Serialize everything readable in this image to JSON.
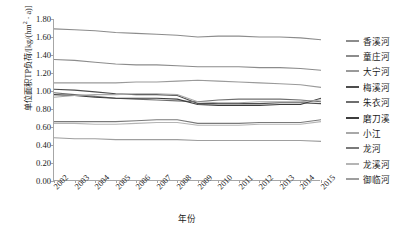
{
  "chart_data": {
    "type": "line",
    "title": "",
    "xlabel": "年份",
    "ylabel": "单位面积TP负荷/[kg/(hm² · a)]",
    "ylabel_parts": {
      "main": "单位面积TP负荷/[kg/(hm",
      "sup": "2",
      "tail": " · a)]"
    },
    "x": [
      2002,
      2003,
      2004,
      2005,
      2006,
      2007,
      2008,
      2009,
      2010,
      2011,
      2012,
      2013,
      2014,
      2015
    ],
    "categories": [
      "2002",
      "2003",
      "2004",
      "2005",
      "2006",
      "2007",
      "2008",
      "2009",
      "2010",
      "2011",
      "2012",
      "2013",
      "2014",
      "2015"
    ],
    "ylim": [
      0.0,
      1.8
    ],
    "yticks": [
      "0.00",
      "0.20",
      "0.40",
      "0.60",
      "0.80",
      "1.00",
      "1.20",
      "1.40",
      "1.60",
      "1.80"
    ],
    "ytick_values": [
      0.0,
      0.2,
      0.4,
      0.6,
      0.8,
      1.0,
      1.2,
      1.4,
      1.6,
      1.8
    ],
    "grid": false,
    "legend_position": "right",
    "series": [
      {
        "name": "香溪河",
        "color": "#8c8c8c",
        "values": [
          1.69,
          1.68,
          1.67,
          1.65,
          1.64,
          1.63,
          1.62,
          1.6,
          1.61,
          1.61,
          1.6,
          1.6,
          1.59,
          1.57
        ]
      },
      {
        "name": "童庄河",
        "color": "#8c8c8c",
        "values": [
          1.35,
          1.34,
          1.32,
          1.3,
          1.29,
          1.29,
          1.28,
          1.27,
          1.27,
          1.27,
          1.26,
          1.26,
          1.25,
          1.23
        ]
      },
      {
        "name": "大宁河",
        "color": "#9a9a9a",
        "values": [
          1.09,
          1.09,
          1.09,
          1.09,
          1.1,
          1.1,
          1.11,
          1.12,
          1.11,
          1.1,
          1.09,
          1.08,
          1.07,
          1.04
        ]
      },
      {
        "name": "梅溪河",
        "color": "#4d4d4d",
        "values": [
          1.02,
          1.01,
          0.99,
          0.97,
          0.96,
          0.96,
          0.95,
          0.86,
          0.86,
          0.86,
          0.86,
          0.87,
          0.87,
          0.86
        ]
      },
      {
        "name": "朱衣河",
        "color": "#6e6e6e",
        "values": [
          0.98,
          0.96,
          0.94,
          0.92,
          0.91,
          0.9,
          0.89,
          0.88,
          0.9,
          0.91,
          0.91,
          0.91,
          0.9,
          0.88
        ]
      },
      {
        "name": "磨刀溪",
        "color": "#3d3d3d",
        "values": [
          0.96,
          0.95,
          0.93,
          0.92,
          0.92,
          0.92,
          0.91,
          0.85,
          0.84,
          0.84,
          0.84,
          0.85,
          0.85,
          0.92
        ]
      },
      {
        "name": "小江",
        "color": "#a8a8a8",
        "values": [
          0.93,
          0.95,
          0.96,
          0.96,
          0.97,
          0.97,
          0.96,
          0.88,
          0.87,
          0.87,
          0.88,
          0.88,
          0.88,
          0.9
        ]
      },
      {
        "name": "龙河",
        "color": "#7a7a7a",
        "values": [
          0.66,
          0.66,
          0.66,
          0.66,
          0.67,
          0.68,
          0.68,
          0.64,
          0.64,
          0.64,
          0.65,
          0.65,
          0.65,
          0.68
        ]
      },
      {
        "name": "龙溪河",
        "color": "#b5b5b5",
        "values": [
          0.64,
          0.64,
          0.63,
          0.63,
          0.64,
          0.65,
          0.65,
          0.62,
          0.62,
          0.62,
          0.63,
          0.63,
          0.63,
          0.66
        ]
      },
      {
        "name": "御临河",
        "color": "#9e9e9e",
        "values": [
          0.48,
          0.47,
          0.47,
          0.46,
          0.46,
          0.46,
          0.46,
          0.45,
          0.45,
          0.45,
          0.45,
          0.45,
          0.45,
          0.44
        ]
      }
    ]
  }
}
